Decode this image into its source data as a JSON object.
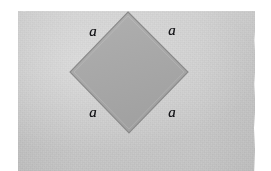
{
  "figure": {
    "kind": "geometry-diagram",
    "background": {
      "paper_color": "#cfcfcf",
      "margin_color": "#ffffff"
    },
    "shape": {
      "name": "square",
      "orientation": "rotated-45-diamond",
      "fill_color": "#a9a9a9",
      "stroke_color": "#8a8a8a",
      "vertices": {
        "top": {
          "x": 128,
          "y": 12
        },
        "right": {
          "x": 188,
          "y": 72
        },
        "bottom": {
          "x": 129,
          "y": 133
        },
        "left": {
          "x": 70,
          "y": 72
        }
      }
    },
    "labels": [
      {
        "id": "top-left",
        "text": "a",
        "x": 93,
        "y": 31,
        "side": "upper-left-side"
      },
      {
        "id": "top-right",
        "text": "a",
        "x": 172,
        "y": 30,
        "side": "upper-right-side"
      },
      {
        "id": "bottom-left",
        "text": "a",
        "x": 93,
        "y": 112,
        "side": "lower-left-side"
      },
      {
        "id": "bottom-right",
        "text": "a",
        "x": 172,
        "y": 112,
        "side": "lower-right-side"
      }
    ]
  }
}
